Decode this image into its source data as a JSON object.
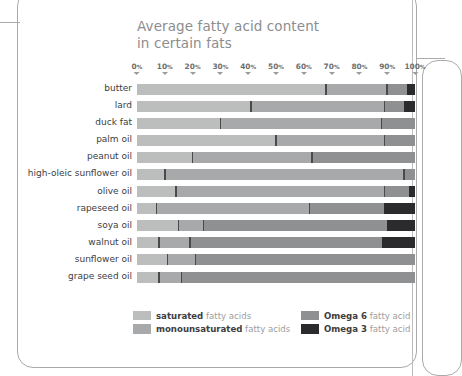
{
  "chart_data": {
    "type": "bar",
    "subtype": "stacked-horizontal-100pct",
    "title": "Average fatty acid content in certain fats",
    "title_lines": [
      "Average fatty acid content",
      "in certain fats"
    ],
    "xlabel": "",
    "ylabel": "",
    "xlim": [
      0,
      100
    ],
    "grid": true,
    "legend_position": "bottom",
    "axis_ticks": [
      "0%",
      "10%",
      "20%",
      "30%",
      "40%",
      "50%",
      "60%",
      "70%",
      "80%",
      "90%",
      "100%"
    ],
    "axis_tick_values": [
      0,
      10,
      20,
      30,
      40,
      50,
      60,
      70,
      80,
      90,
      100
    ],
    "categories": [
      "butter",
      "lard",
      "duck fat",
      "palm oil",
      "peanut oil",
      "high-oleic sunflower oil",
      "olive oil",
      "rapeseed oil",
      "soya oil",
      "walnut oil",
      "sunflower oil",
      "grape seed oil"
    ],
    "series": [
      {
        "name": "saturated fatty acids",
        "color": "#bcbdbd",
        "values": [
          68,
          41,
          30,
          50,
          20,
          10,
          14,
          7,
          15,
          8,
          11,
          8
        ]
      },
      {
        "name": "monounsaturated fatty acids",
        "color": "#a8a9aa",
        "values": [
          22,
          48,
          58,
          39,
          43,
          86,
          75,
          55,
          9,
          11,
          10,
          8
        ]
      },
      {
        "name": "Omega 6 fatty acid",
        "color": "#8f9092",
        "values": [
          7,
          7,
          12,
          11,
          37,
          4,
          11,
          27,
          66,
          69,
          79,
          84
        ]
      },
      {
        "name": "Omega 3 fatty acid",
        "color": "#2b2b2d",
        "values": [
          3,
          4,
          0,
          0,
          0,
          0,
          0,
          11,
          10,
          12,
          0,
          0
        ]
      }
    ],
    "boundaries": [
      {
        "category": "butter",
        "b1": 68,
        "b2": 90,
        "b3": 97
      },
      {
        "category": "lard",
        "b1": 41,
        "b2": 89,
        "b3": 96
      },
      {
        "category": "duck fat",
        "b1": 30,
        "b2": 88,
        "b3": 100
      },
      {
        "category": "palm oil",
        "b1": 50,
        "b2": 89,
        "b3": 100
      },
      {
        "category": "peanut oil",
        "b1": 20,
        "b2": 63,
        "b3": 100
      },
      {
        "category": "high-oleic sunflower oil",
        "b1": 10,
        "b2": 96,
        "b3": 100
      },
      {
        "category": "olive oil",
        "b1": 14,
        "b2": 89,
        "b3": 98
      },
      {
        "category": "rapeseed oil",
        "b1": 7,
        "b2": 62,
        "b3": 89
      },
      {
        "category": "soya oil",
        "b1": 15,
        "b2": 24,
        "b3": 90
      },
      {
        "category": "walnut oil",
        "b1": 8,
        "b2": 19,
        "b3": 88
      },
      {
        "category": "sunflower oil",
        "b1": 11,
        "b2": 21,
        "b3": 100
      },
      {
        "category": "grape seed oil",
        "b1": 8,
        "b2": 16,
        "b3": 100
      }
    ]
  },
  "legend": {
    "items": [
      {
        "bold": "saturated",
        "rest": " fatty acids",
        "color": "#bcbdbd",
        "col": 0,
        "row": 0
      },
      {
        "bold": "monounsaturated",
        "rest": " fatty acids",
        "color": "#a8a9aa",
        "col": 0,
        "row": 1
      },
      {
        "bold": "Omega 6",
        "rest": " fatty acid",
        "color": "#8f9092",
        "col": 1,
        "row": 0
      },
      {
        "bold": "Omega 3",
        "rest": " fatty acid",
        "color": "#2b2b2d",
        "col": 1,
        "row": 1
      }
    ]
  },
  "colors": {
    "saturated": "#bcbdbd",
    "monounsaturated": "#a8a9aa",
    "omega6": "#8f9092",
    "omega3": "#2b2b2d",
    "divider": "#4a4a4c",
    "title_text": "#8c8d8f",
    "label_text": "#3d3d3f",
    "tick_text": "#6e6f71",
    "frame": "#a9aaac"
  }
}
